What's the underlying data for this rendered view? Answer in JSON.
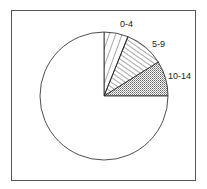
{
  "chart_data": {
    "type": "pie",
    "title": "",
    "note": "No numeric values are printed on the chart; slice angles are approximate measurements from the drawing.",
    "slices": [
      {
        "label": "0-4",
        "start_deg": 0,
        "end_deg": 22,
        "pattern": "diagonal-wide"
      },
      {
        "label": "5-9",
        "start_deg": 22,
        "end_deg": 58,
        "pattern": "diagonal-dense"
      },
      {
        "label": "10-14",
        "start_deg": 58,
        "end_deg": 90,
        "pattern": "crosshatch-fine"
      },
      {
        "label": "",
        "start_deg": 90,
        "end_deg": 360,
        "pattern": "none"
      }
    ],
    "legend": "none (labels placed next to slices)"
  },
  "labels": {
    "slice0": "0-4",
    "slice1": "5-9",
    "slice2": "10-14"
  }
}
